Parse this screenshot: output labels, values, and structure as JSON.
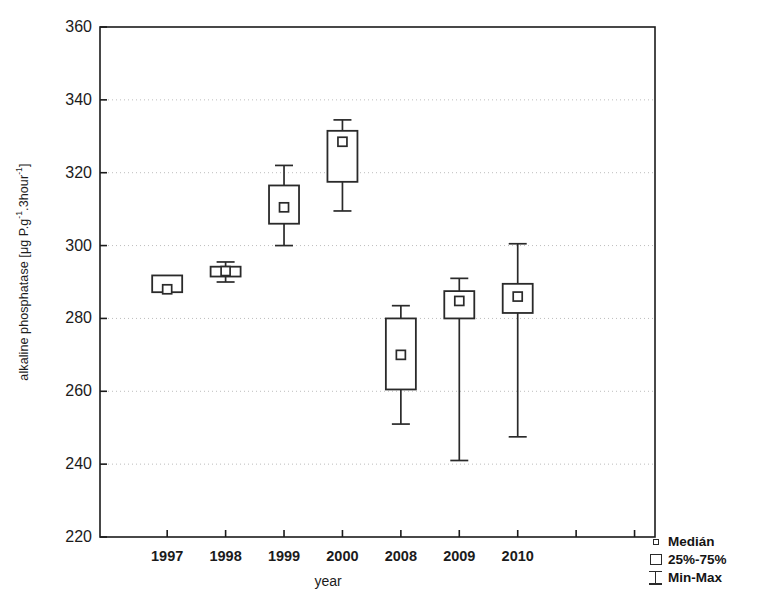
{
  "chart_data": {
    "type": "box",
    "title": "",
    "xlabel": "year",
    "ylabel": "alkaline phosphatase [μg P.g⁻¹.3hour⁻¹]",
    "ylabel_parts": {
      "prefix": "alkaline phosphatase [μg P.g",
      "sup1": "-1",
      "mid": ".3hour",
      "sup2": "-1",
      "suffix": "]"
    },
    "categories": [
      "1997",
      "1998",
      "1999",
      "2000",
      "2008",
      "2009",
      "2010"
    ],
    "ylim": [
      220,
      360
    ],
    "yticks": [
      220,
      240,
      260,
      280,
      300,
      320,
      340,
      360
    ],
    "ytick_labels": [
      "220",
      "240",
      "260",
      "280",
      "300",
      "320",
      "340",
      "360"
    ],
    "grid": "horizontal-dotted",
    "legend_position": "bottom-right",
    "boxes": [
      {
        "category": "1997",
        "min": 287.2,
        "q1": 287.2,
        "median": 288.0,
        "q3": 291.8,
        "max": 291.8
      },
      {
        "category": "1998",
        "min": 290.0,
        "q1": 291.5,
        "median": 293.0,
        "q3": 294.2,
        "max": 295.5
      },
      {
        "category": "1999",
        "min": 300.0,
        "q1": 306.0,
        "median": 310.5,
        "q3": 316.5,
        "max": 322.0
      },
      {
        "category": "2000",
        "min": 309.5,
        "q1": 317.5,
        "median": 328.5,
        "q3": 331.5,
        "max": 334.5
      },
      {
        "category": "2008",
        "min": 251.0,
        "q1": 260.5,
        "median": 270.0,
        "q3": 280.0,
        "max": 283.5
      },
      {
        "category": "2009",
        "min": 241.0,
        "q1": 280.0,
        "median": 284.8,
        "q3": 287.5,
        "max": 291.0
      },
      {
        "category": "2010",
        "min": 247.5,
        "q1": 281.5,
        "median": 286.0,
        "q3": 289.5,
        "max": 300.5
      }
    ]
  },
  "legend": {
    "entries": [
      {
        "key": "median-marker",
        "label": "Medián"
      },
      {
        "key": "box-marker",
        "label": "25%-75%"
      },
      {
        "key": "minmax-marker",
        "label": "Min-Max"
      }
    ]
  },
  "colors": {
    "line": "#2a2a2a",
    "grid": "#bdbdbd",
    "axis": "#1b1b1b",
    "background": "#ffffff"
  }
}
